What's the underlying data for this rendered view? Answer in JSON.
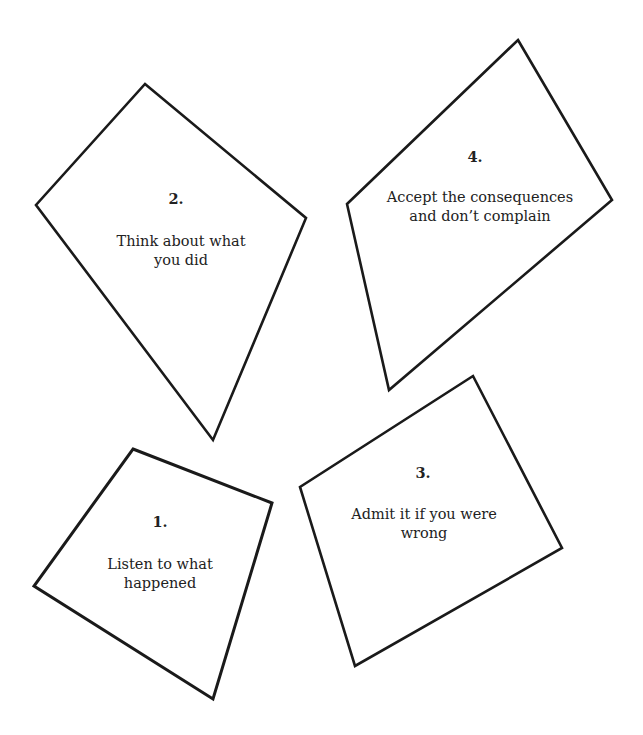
{
  "cards": [
    {
      "id": "step-1",
      "number": "1.",
      "text_lines": [
        "Listen to what",
        "happened"
      ]
    },
    {
      "id": "step-2",
      "number": "2.",
      "text_lines": [
        "Think about what",
        "you did"
      ]
    },
    {
      "id": "step-3",
      "number": "3.",
      "text_lines": [
        "Admit it if you were",
        "wrong"
      ]
    },
    {
      "id": "step-4",
      "number": "4.",
      "text_lines": [
        "Accept the consequences",
        "and don’t complain"
      ]
    }
  ],
  "colors": {
    "stroke": "#1a1a1a",
    "text": "#222222",
    "background": "#ffffff"
  }
}
